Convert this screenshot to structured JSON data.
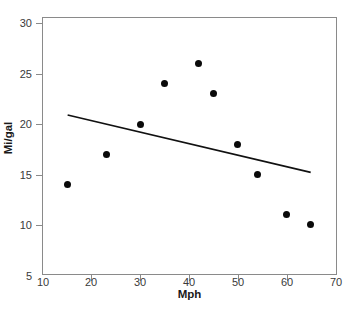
{
  "chart_data": {
    "type": "scatter",
    "title": "",
    "xlabel": "Mph",
    "ylabel": "Mi/gal",
    "xlim": [
      10,
      70
    ],
    "ylim": [
      5,
      30
    ],
    "xticks": [
      10,
      20,
      30,
      40,
      50,
      60,
      70
    ],
    "yticks": [
      5,
      10,
      15,
      20,
      25,
      30
    ],
    "xtick_labels": [
      "10",
      "20",
      "30",
      "40",
      "50",
      "60",
      "70"
    ],
    "ytick_labels": [
      "5",
      "10",
      "15",
      "20",
      "25",
      "30"
    ],
    "grid": false,
    "legend": null,
    "marker": {
      "shape": "circle",
      "color": "#0a0a0a",
      "size": 7
    },
    "points": [
      {
        "x": 15,
        "y": 14
      },
      {
        "x": 23,
        "y": 17
      },
      {
        "x": 30,
        "y": 20
      },
      {
        "x": 35,
        "y": 24
      },
      {
        "x": 42,
        "y": 26
      },
      {
        "x": 45,
        "y": 23
      },
      {
        "x": 50,
        "y": 18
      },
      {
        "x": 54,
        "y": 15
      },
      {
        "x": 60,
        "y": 11
      },
      {
        "x": 65,
        "y": 10
      }
    ],
    "trendline": {
      "type": "linear-fit",
      "color": "#111111",
      "x_start": 15,
      "y_start": 20.9,
      "x_end": 65,
      "y_end": 15.2
    },
    "frame_color": "#8a8a8a",
    "background": "#ffffff"
  }
}
